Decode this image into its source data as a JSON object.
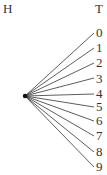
{
  "diagram": {
    "type": "tree",
    "root_header": "H",
    "leaf_header": "T",
    "leaves": [
      "0",
      "1",
      "2",
      "3",
      "4",
      "5",
      "6",
      "7",
      "8",
      "9"
    ],
    "line_color": "#333333"
  }
}
